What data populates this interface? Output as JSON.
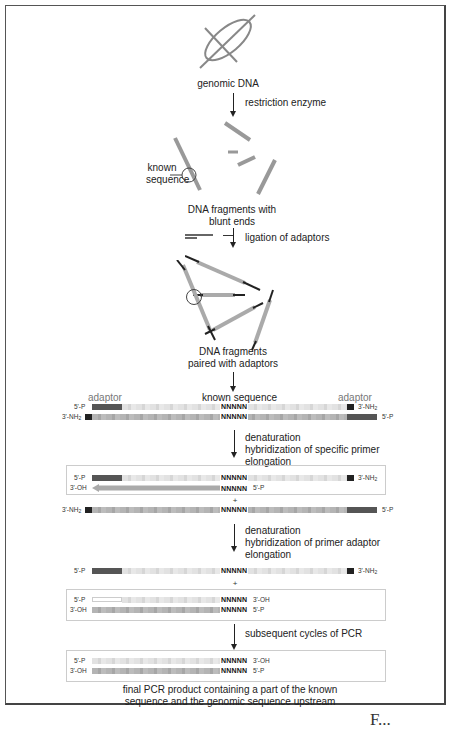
{
  "diagram": {
    "steps": {
      "genomic_dna_label": "genomic DNA",
      "step1": "restriction enzyme",
      "known_sequence_label_line1": "known",
      "known_sequence_label_line2": "sequence",
      "fragments_label_line1": "DNA fragments with",
      "fragments_label_line2": "blunt ends",
      "step2": "ligation of adaptors",
      "paired_label_line1": "DNA fragments",
      "paired_label_line2": "paired with adaptors",
      "adaptor_left": "adaptor",
      "known_sequence_header": "known sequence",
      "adaptor_right": "adaptor",
      "step3_line1": "denaturation",
      "step3_line2": "hybridization of specific primer",
      "step3_line3": "elongation",
      "step4_line1": "denaturation",
      "step4_line2": "hybridization of primer adaptor",
      "step4_line3": "elongation",
      "step5": "subsequent cycles of PCR",
      "final_caption_line1": "final PCR product containing a part of the known",
      "final_caption_line2": "sequence and the genomic sequence upstream"
    },
    "ends": {
      "p5": "5'-P",
      "nh2": "3'-NH",
      "nh2_sub": "2",
      "oh3": "3'-OH"
    },
    "known_seq": "NNNNN",
    "plus": "+",
    "footer_partial": "F..."
  },
  "colors": {
    "adaptor_dark": "#555555",
    "adaptor_black": "#222222",
    "strand_light": "#e2e2e2",
    "strand_mid": "#b4b4b4",
    "frame": "#555555"
  }
}
